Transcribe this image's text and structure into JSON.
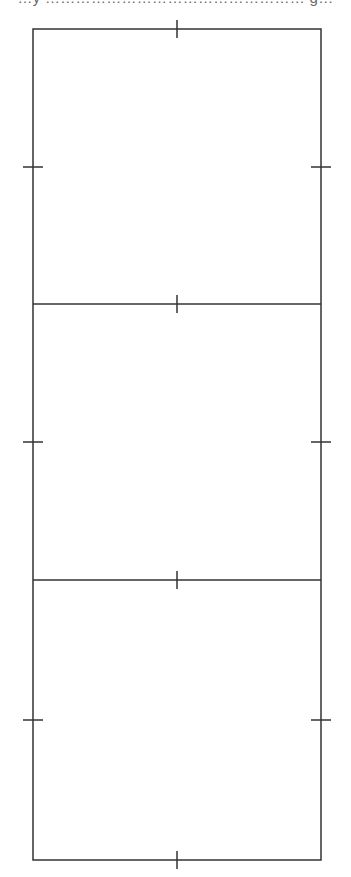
{
  "caption": {
    "text": "…y …………………………………………… g…",
    "note": "cut off at top edge; only descenders visible"
  },
  "diagram": {
    "stroke_color": "#333333",
    "background": "#ffffff",
    "frame": {
      "left": 33,
      "right": 321,
      "top": 29,
      "bottom": 860
    },
    "panels": [
      {
        "index": 1,
        "top": 29,
        "bottom": 304
      },
      {
        "index": 2,
        "top": 304,
        "bottom": 580
      },
      {
        "index": 3,
        "top": 580,
        "bottom": 860
      }
    ],
    "ticks": {
      "center_x": 177,
      "horizontal_edges_y": [
        29,
        304,
        580,
        860
      ],
      "vertical_half_length": 9,
      "side_y": [
        167,
        442,
        720
      ],
      "side_half_length": 10
    }
  }
}
